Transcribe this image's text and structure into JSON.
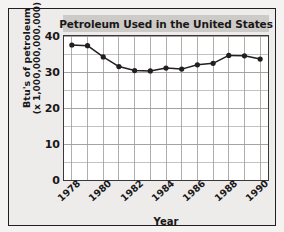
{
  "chart_data": {
    "type": "line",
    "title": "Petroleum Used in the United States",
    "xlabel": "Year",
    "ylabel_line1": "Btu's of petroleum",
    "ylabel_line2": "(x 1,000,000,000,000)",
    "x": [
      1978,
      1979,
      1980,
      1981,
      1982,
      1983,
      1984,
      1985,
      1986,
      1987,
      1988,
      1989,
      1990
    ],
    "values": [
      37.5,
      37.3,
      34.2,
      31.5,
      30.4,
      30.3,
      31.1,
      30.8,
      32.0,
      32.4,
      34.6,
      34.5,
      33.6
    ],
    "xlim": [
      1977.5,
      1990.5
    ],
    "ylim": [
      0,
      40
    ],
    "yticks": [
      0,
      10,
      20,
      30,
      40
    ],
    "ytick_labels": [
      "0",
      "10",
      "20",
      "30",
      "40"
    ],
    "xticks": [
      1978,
      1980,
      1982,
      1984,
      1986,
      1988,
      1990
    ],
    "xtick_labels": [
      "1978",
      "1980",
      "1982",
      "1984",
      "1986",
      "1988",
      "1990"
    ],
    "y_minor_step": 5,
    "x_minor_step": 1,
    "grid": true,
    "legend": null,
    "series_color": "#231f20",
    "marker": "circle",
    "marker_color": "#231f20"
  },
  "style": {
    "title_band_color": "#cdcbc8",
    "card_background": "#edecea",
    "plot_background": "#ffffff",
    "frame_color": "#231f20",
    "grid_color": "#9b9a99",
    "text_color": "#1a1718"
  }
}
